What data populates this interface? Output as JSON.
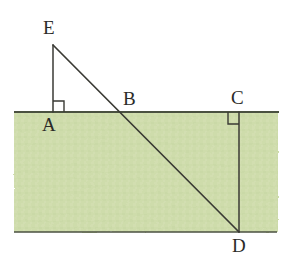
{
  "figure": {
    "background_color": "#ffffff",
    "shaded_region": {
      "name": "ground-band",
      "fill_color": "#cedcab",
      "edge_color": "#5f6a50",
      "x": 14,
      "y": 112,
      "width": 264,
      "height": 120
    },
    "stroke_color": "#3a3a34",
    "labels": {
      "E": "E",
      "A": "A",
      "B": "B",
      "C": "C",
      "D": "D"
    },
    "points": [
      {
        "id": "E",
        "label": "E",
        "x": 53,
        "y": 45
      },
      {
        "id": "A",
        "label": "A",
        "x": 53,
        "y": 112
      },
      {
        "id": "B",
        "label": "B",
        "x": 120,
        "y": 112
      },
      {
        "id": "C",
        "label": "C",
        "x": 239,
        "y": 112
      },
      {
        "id": "D",
        "label": "D",
        "x": 239,
        "y": 232
      }
    ],
    "segments": [
      {
        "id": "ground-line",
        "from": "A-left-edge",
        "to": "right-edge",
        "x1": 14,
        "y1": 112,
        "x2": 279,
        "y2": 112
      },
      {
        "id": "bottom-line",
        "from": "left-edge",
        "to": "right-edge",
        "x1": 14,
        "y1": 232,
        "x2": 277,
        "y2": 232
      },
      {
        "id": "segment-EA",
        "from": "E",
        "to": "A",
        "x1": 53,
        "y1": 45,
        "x2": 53,
        "y2": 112
      },
      {
        "id": "segment-ED",
        "from": "E",
        "to": "D",
        "x1": 53,
        "y1": 45,
        "x2": 239,
        "y2": 232
      },
      {
        "id": "segment-CD",
        "from": "C",
        "to": "D",
        "x1": 239,
        "y1": 112,
        "x2": 239,
        "y2": 232
      }
    ],
    "right_angle_marks": [
      {
        "id": "right-angle-at-A",
        "vertex": "A",
        "x": 53,
        "y": 112,
        "size": 11,
        "dx": 1,
        "dy": -1
      },
      {
        "id": "right-angle-at-C",
        "vertex": "C",
        "x": 239,
        "y": 112,
        "size": 11,
        "dx": -1,
        "dy": 1
      }
    ]
  }
}
